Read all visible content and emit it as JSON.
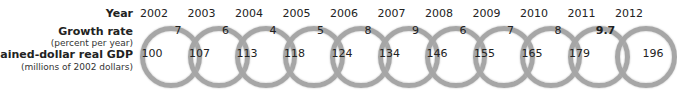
{
  "labels": {
    "year": "Year",
    "growth_rate": "Growth rate",
    "growth_rate_unit": "(percent per year)",
    "gdp": "Chained-dollar real GDP",
    "gdp_unit": "(millions of 2002 dollars)"
  },
  "years": [
    "2002",
    "2003",
    "2004",
    "2005",
    "2006",
    "2007",
    "2008",
    "2009",
    "2010",
    "2011",
    "2012"
  ],
  "growth_rates": [
    "7",
    "6",
    "4",
    "5",
    "8",
    "9",
    "6",
    "7",
    "8",
    "9.7"
  ],
  "gdp_values": [
    "100",
    "107",
    "113",
    "118",
    "124",
    "134",
    "146",
    "155",
    "165",
    "179",
    "196"
  ],
  "colors": {
    "ring": "#a6a6a6"
  }
}
